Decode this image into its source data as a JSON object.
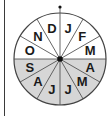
{
  "diagram": {
    "type": "month-wheel",
    "center": [
      60,
      59
    ],
    "radius": 46,
    "colors": {
      "light_half": "#ffffff",
      "shaded_half": "#d6d6d6",
      "lines": "#555555",
      "outline": "#444444",
      "center_dot": "#111111",
      "label": "#1a1a1a"
    },
    "months": [
      {
        "label": "J",
        "shaded": false
      },
      {
        "label": "F",
        "shaded": false
      },
      {
        "label": "M",
        "shaded": false
      },
      {
        "label": "A",
        "shaded": true
      },
      {
        "label": "M",
        "shaded": true
      },
      {
        "label": "J",
        "shaded": true
      },
      {
        "label": "J",
        "shaded": true
      },
      {
        "label": "A",
        "shaded": true
      },
      {
        "label": "S",
        "shaded": true
      },
      {
        "label": "O",
        "shaded": false
      },
      {
        "label": "N",
        "shaded": false
      },
      {
        "label": "D",
        "shaded": false
      }
    ],
    "top_marker": "dot"
  }
}
